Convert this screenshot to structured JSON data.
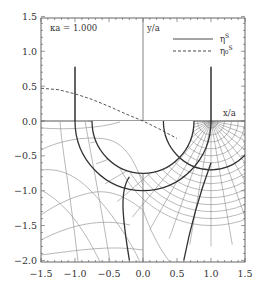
{
  "chart_data": {
    "type": "line",
    "title": "",
    "annotation": "κa = 1.000",
    "xlabel": "x/a",
    "ylabel": "y/a",
    "xlim": [
      -1.5,
      1.5
    ],
    "ylim": [
      -2.0,
      1.5
    ],
    "xticks": [
      "-1.5",
      "-1.0",
      "-0.5",
      "0.0",
      "0.5",
      "1.0",
      "1.5"
    ],
    "yticks": [
      "1.5",
      "1.0",
      "0.5",
      "0.0",
      "-0.5",
      "-1.0",
      "-1.5",
      "-2.0"
    ],
    "grid": false,
    "legend_position": "upper right",
    "series": [
      {
        "name": "η^S",
        "style": "solid",
        "description": "vertical bars at x=±1 rising to y≈0.78",
        "segments": [
          {
            "x": [
              -1.0,
              -1.0
            ],
            "y": [
              0.0,
              0.78
            ]
          },
          {
            "x": [
              1.0,
              1.0
            ],
            "y": [
              0.0,
              0.78
            ]
          }
        ]
      },
      {
        "name": "η₀^S",
        "style": "dashed",
        "x": [
          -1.5,
          -1.25,
          -1.0,
          -0.75,
          -0.5,
          -0.25,
          0.0,
          0.25,
          0.5
        ],
        "y": [
          0.47,
          0.45,
          0.39,
          0.31,
          0.21,
          0.1,
          0.0,
          -0.12,
          -0.25
        ]
      }
    ],
    "lower_half": {
      "description": "field-line / equipotential mesh in y<0 with semicircular boundaries",
      "thick_semicircle_inner": {
        "center": [
          0.0,
          0.0
        ],
        "radius": 0.75
      },
      "thick_semicircle_outer": {
        "center": [
          0.0,
          0.0
        ],
        "radius": 1.0
      },
      "dense_mesh_center": [
        1.0,
        0.0
      ]
    }
  },
  "legend": {
    "items": [
      {
        "label": "η",
        "sup": "S",
        "style": "solid"
      },
      {
        "label": "η₀",
        "sup": "S",
        "style": "dashed"
      }
    ]
  },
  "labels": {
    "kappa": "κa = 1.000",
    "ylabel": "y/a",
    "xlabel": "x/a"
  }
}
